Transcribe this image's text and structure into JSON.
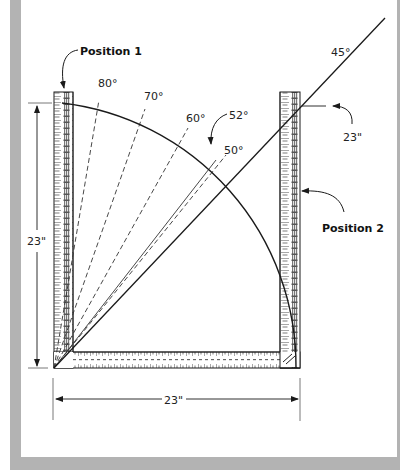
{
  "diagram": {
    "labels": {
      "position1": "Position 1",
      "position2": "Position 2",
      "angle80": "80°",
      "angle70": "70°",
      "angle60": "60°",
      "angle52": "52°",
      "angle50": "50°",
      "angle45": "45°",
      "height_dim": "23\"",
      "width_dim": "23\"",
      "right_dim": "23\""
    },
    "colors": {
      "frame": "#b3b3b3",
      "line": "#1a1a1a",
      "ruler_fill": "#ffffff",
      "ruler_stripe": "#888888"
    }
  }
}
